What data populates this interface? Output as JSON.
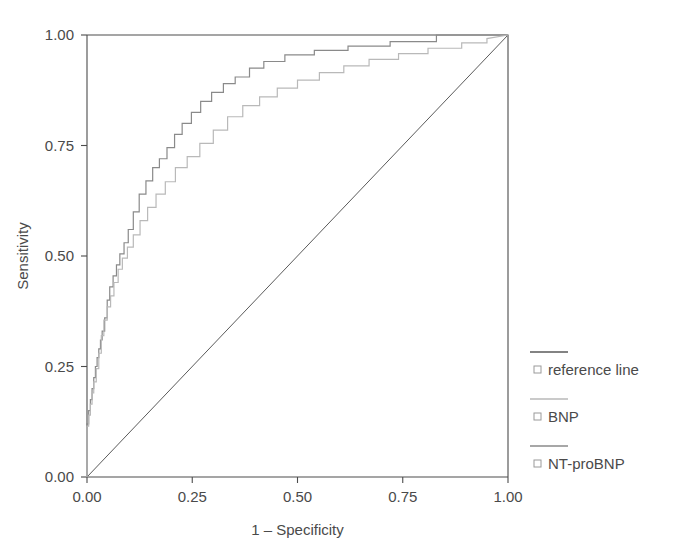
{
  "figure": {
    "width": 675,
    "height": 560,
    "background": "#ffffff"
  },
  "plot": {
    "left": 87,
    "right": 508,
    "top": 35,
    "bottom": 477
  },
  "colors": {
    "axis": "#4c4c4c",
    "text": "#4a4a4a",
    "reference_line": "#5a5a5a",
    "bnp": "#b9b9b9",
    "nt_probnp": "#8a8a8a",
    "legend_marker": "#9a9a9a"
  },
  "legend": {
    "position": "right",
    "items": [
      {
        "label": "reference line",
        "color": "#5a5a5a",
        "marker": "open-square",
        "swatch_y": 352,
        "label_y": 375
      },
      {
        "label": "BNP",
        "color": "#b9b9b9",
        "marker": "open-square",
        "swatch_y": 399,
        "label_y": 422
      },
      {
        "label": "NT-proBNP",
        "color": "#8a8a8a",
        "marker": "open-square",
        "swatch_y": 446,
        "label_y": 469
      }
    ]
  },
  "chart_data": {
    "type": "line",
    "title": "",
    "subtitle": "",
    "xlabel": "1 – Specificity",
    "ylabel": "Sensitivity",
    "xlim": [
      0,
      1
    ],
    "ylim": [
      0,
      1
    ],
    "grid": false,
    "xticks": [
      0,
      0.25,
      0.5,
      0.75,
      1
    ],
    "yticks": [
      0,
      0.25,
      0.5,
      0.75,
      1
    ],
    "xtick_labels": [
      "0.00",
      "0.25",
      "0.50",
      "0.75",
      "1.00"
    ],
    "ytick_labels": [
      "0.00",
      "0.25",
      "0.50",
      "0.75",
      "1.00"
    ],
    "legend_position": "right",
    "series": [
      {
        "name": "reference line",
        "style": "diagonal",
        "color": "#5a5a5a",
        "x": [
          0,
          1
        ],
        "y": [
          0,
          1
        ]
      },
      {
        "name": "NT-proBNP",
        "style": "step",
        "color": "#8a8a8a",
        "x": [
          0.0,
          0.0,
          0.004,
          0.004,
          0.008,
          0.008,
          0.012,
          0.012,
          0.016,
          0.016,
          0.02,
          0.02,
          0.024,
          0.024,
          0.028,
          0.028,
          0.032,
          0.032,
          0.036,
          0.036,
          0.042,
          0.042,
          0.048,
          0.048,
          0.054,
          0.054,
          0.062,
          0.062,
          0.07,
          0.07,
          0.078,
          0.078,
          0.088,
          0.088,
          0.098,
          0.098,
          0.11,
          0.11,
          0.124,
          0.124,
          0.14,
          0.14,
          0.156,
          0.156,
          0.172,
          0.172,
          0.19,
          0.19,
          0.208,
          0.208,
          0.226,
          0.226,
          0.248,
          0.248,
          0.27,
          0.27,
          0.296,
          0.296,
          0.324,
          0.324,
          0.352,
          0.352,
          0.386,
          0.386,
          0.42,
          0.42,
          0.47,
          0.47,
          0.54,
          0.54,
          0.62,
          0.62,
          0.72,
          0.72,
          0.83,
          0.83,
          1.0
        ],
        "y": [
          0.0,
          0.12,
          0.12,
          0.15,
          0.15,
          0.175,
          0.175,
          0.2,
          0.2,
          0.225,
          0.225,
          0.25,
          0.25,
          0.27,
          0.27,
          0.29,
          0.29,
          0.31,
          0.31,
          0.33,
          0.33,
          0.36,
          0.36,
          0.4,
          0.4,
          0.43,
          0.43,
          0.455,
          0.455,
          0.48,
          0.48,
          0.505,
          0.505,
          0.53,
          0.53,
          0.56,
          0.56,
          0.6,
          0.6,
          0.64,
          0.64,
          0.67,
          0.67,
          0.7,
          0.7,
          0.72,
          0.72,
          0.745,
          0.745,
          0.775,
          0.775,
          0.8,
          0.8,
          0.825,
          0.825,
          0.85,
          0.85,
          0.87,
          0.87,
          0.89,
          0.89,
          0.905,
          0.905,
          0.925,
          0.925,
          0.94,
          0.94,
          0.955,
          0.955,
          0.965,
          0.965,
          0.975,
          0.975,
          0.985,
          0.985,
          1.0,
          1.0
        ]
      },
      {
        "name": "BNP",
        "style": "step",
        "color": "#b9b9b9",
        "x": [
          0.0,
          0.0,
          0.004,
          0.004,
          0.008,
          0.008,
          0.012,
          0.012,
          0.016,
          0.016,
          0.022,
          0.022,
          0.028,
          0.028,
          0.034,
          0.034,
          0.04,
          0.04,
          0.048,
          0.048,
          0.056,
          0.056,
          0.064,
          0.064,
          0.074,
          0.074,
          0.084,
          0.084,
          0.096,
          0.096,
          0.11,
          0.11,
          0.126,
          0.126,
          0.144,
          0.144,
          0.164,
          0.164,
          0.186,
          0.186,
          0.21,
          0.21,
          0.238,
          0.238,
          0.268,
          0.268,
          0.3,
          0.3,
          0.334,
          0.334,
          0.37,
          0.37,
          0.41,
          0.41,
          0.452,
          0.452,
          0.5,
          0.5,
          0.552,
          0.552,
          0.61,
          0.61,
          0.67,
          0.67,
          0.74,
          0.74,
          0.81,
          0.81,
          0.89,
          0.89,
          0.95,
          0.95,
          1.0
        ],
        "y": [
          0.0,
          0.115,
          0.115,
          0.14,
          0.14,
          0.165,
          0.165,
          0.19,
          0.19,
          0.215,
          0.215,
          0.245,
          0.245,
          0.28,
          0.28,
          0.32,
          0.32,
          0.355,
          0.355,
          0.385,
          0.385,
          0.41,
          0.41,
          0.44,
          0.44,
          0.47,
          0.47,
          0.495,
          0.495,
          0.52,
          0.52,
          0.548,
          0.548,
          0.58,
          0.58,
          0.61,
          0.61,
          0.64,
          0.64,
          0.668,
          0.668,
          0.7,
          0.7,
          0.725,
          0.725,
          0.755,
          0.755,
          0.785,
          0.785,
          0.815,
          0.815,
          0.84,
          0.84,
          0.86,
          0.86,
          0.88,
          0.88,
          0.898,
          0.898,
          0.915,
          0.915,
          0.93,
          0.93,
          0.945,
          0.945,
          0.958,
          0.958,
          0.97,
          0.97,
          0.982,
          0.982,
          0.992,
          1.0
        ]
      }
    ]
  }
}
